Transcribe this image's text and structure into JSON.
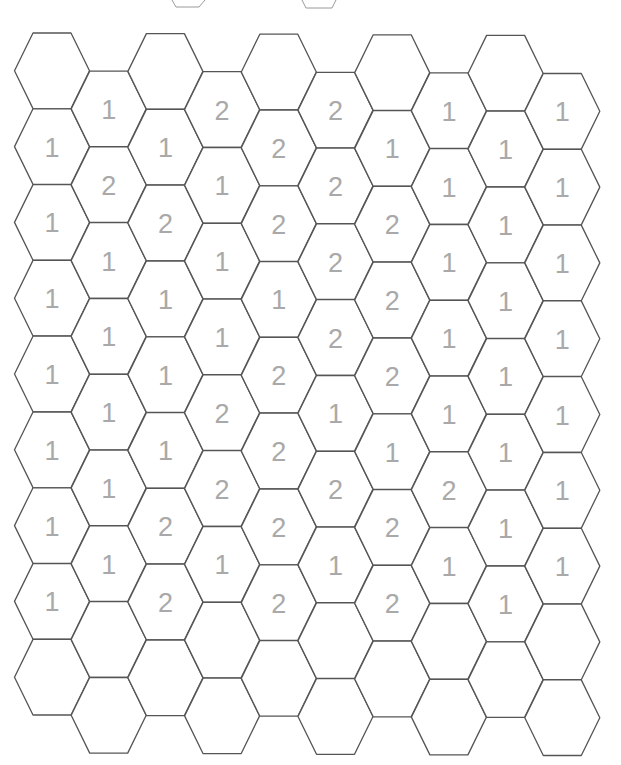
{
  "board": {
    "type": "hex-grid",
    "orientation": "flat-top",
    "columns": 10,
    "rows_per_column": 9,
    "colors": {
      "background": "#ffffff",
      "cell_stroke": "#555555",
      "number_fill": "#a9a9a9",
      "fragment_stroke": "#9a9a9a"
    },
    "geometry": {
      "col0_center_x": 52,
      "col_spacing": 56.7,
      "even_col_first_center_y": 70.8,
      "odd_col_first_center_y": 108.6,
      "row_spacing": 75.8,
      "drift_per_col": 0.3,
      "half_width": 37.5,
      "top_half_width": 19,
      "half_height": 37.8
    },
    "top_fragments": [
      {
        "x_left": 172,
        "x_right": 205,
        "bottom_left": 176,
        "bottom_right": 199,
        "y_bottom": 7
      },
      {
        "x_left": 302,
        "x_right": 336,
        "bottom_left": 306,
        "bottom_right": 332,
        "y_bottom": 8
      }
    ],
    "cells": [
      [
        "",
        "1",
        "1",
        "1",
        "1",
        "1",
        "1",
        "1",
        ""
      ],
      [
        "1",
        "2",
        "1",
        "1",
        "1",
        "1",
        "1",
        "",
        ""
      ],
      [
        "",
        "1",
        "2",
        "1",
        "1",
        "1",
        "2",
        "2",
        ""
      ],
      [
        "2",
        "1",
        "1",
        "1",
        "2",
        "2",
        "1",
        "",
        ""
      ],
      [
        "",
        "2",
        "2",
        "1",
        "2",
        "2",
        "2",
        "2",
        ""
      ],
      [
        "2",
        "2",
        "2",
        "2",
        "1",
        "2",
        "1",
        "",
        ""
      ],
      [
        "",
        "1",
        "2",
        "2",
        "2",
        "1",
        "2",
        "2",
        ""
      ],
      [
        "1",
        "1",
        "1",
        "1",
        "1",
        "2",
        "1",
        "",
        ""
      ],
      [
        "",
        "1",
        "1",
        "1",
        "1",
        "1",
        "1",
        "1",
        ""
      ],
      [
        "1",
        "1",
        "1",
        "1",
        "1",
        "1",
        "1",
        "",
        ""
      ]
    ]
  }
}
